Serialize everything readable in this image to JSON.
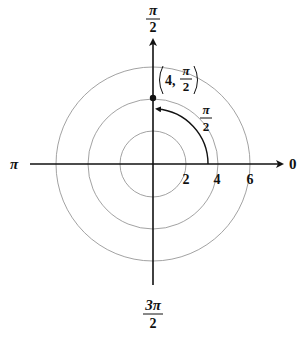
{
  "diagram": {
    "type": "polar-coordinate-plot",
    "center": {
      "x": 153,
      "y": 164
    },
    "circle_radii_units": [
      2,
      4,
      6
    ],
    "pixels_per_unit": 16.2,
    "angle_labels": {
      "right": "0",
      "top_num": "π",
      "top_den": "2",
      "left": "π",
      "bottom_num": "3π",
      "bottom_den": "2"
    },
    "radius_labels": [
      "2",
      "4",
      "6"
    ],
    "point": {
      "r": 4,
      "theta_label_num": "π",
      "theta_label_den": "2",
      "coord_r": "4,"
    },
    "arc_label_num": "π",
    "arc_label_den": "2",
    "colors": {
      "axis": "#111111",
      "circle": "#888888",
      "arc": "#111111",
      "point": "#111111"
    }
  }
}
